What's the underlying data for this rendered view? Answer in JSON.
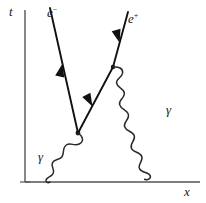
{
  "figure": {
    "type": "feynman-diagram",
    "background_color": "#ffffff",
    "ink_color": "#1a1a1a"
  },
  "axes": {
    "vertical": {
      "label": "t",
      "name": "time-axis",
      "x": 25,
      "y_top": 10,
      "y_bottom": 182,
      "label_x": 9,
      "label_y": 5
    },
    "horizontal": {
      "label": "x",
      "name": "space-axis",
      "y": 182,
      "x_left": 25,
      "x_right": 200,
      "label_x": 184,
      "label_y": 185
    },
    "color": "#555555"
  },
  "vertices": [
    {
      "name": "vertex-lower",
      "x": 78,
      "y": 133
    },
    {
      "name": "vertex-upper",
      "x": 113,
      "y": 67
    }
  ],
  "fermion_lines": [
    {
      "name": "electron-line",
      "label": "e",
      "charge": "−",
      "label_full": "e⁻",
      "from": {
        "x": 50,
        "y": 8
      },
      "to": {
        "x": 78,
        "y": 133
      },
      "arrow_direction": "up-left",
      "arrow_at": 0.5,
      "label_x": 47,
      "label_y": 6
    },
    {
      "name": "positron-line",
      "label": "e",
      "charge": "+",
      "label_full": "e⁺",
      "from": {
        "x": 78,
        "y": 133
      },
      "via": {
        "x": 113,
        "y": 67
      },
      "to": {
        "x": 128,
        "y": 12
      },
      "arrow_direction": "down-left",
      "arrows_at": [
        0.42,
        0.82
      ],
      "label_x": 128,
      "label_y": 12
    }
  ],
  "photon_lines": [
    {
      "name": "photon-incoming",
      "label": "γ",
      "from": {
        "x": 78,
        "y": 133
      },
      "to": {
        "x": 50,
        "y": 182
      },
      "label_x": 38,
      "label_y": 150,
      "wavelength": 11,
      "amplitude": 5
    },
    {
      "name": "photon-outgoing",
      "label": "γ",
      "from": {
        "x": 113,
        "y": 67
      },
      "to": {
        "x": 180,
        "y": 178
      },
      "label_x": 166,
      "label_y": 103,
      "wavelength": 11,
      "amplitude": 5
    }
  ],
  "caption": {
    "text": "",
    "visible": false
  }
}
